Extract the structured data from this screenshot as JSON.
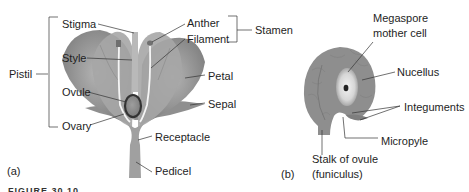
{
  "figure": {
    "caption_partial": "FIGURE 30.10",
    "panel_a": {
      "panel_label": "(a)",
      "group_labels": {
        "pistil": "Pistil",
        "stamen": "Stamen"
      },
      "labels": {
        "stigma": "Stigma",
        "style": "Style",
        "ovule": "Ovule",
        "ovary": "Ovary",
        "anther": "Anther",
        "filament": "Filament",
        "petal": "Petal",
        "sepal": "Sepal",
        "receptacle": "Receptacle",
        "pedicel": "Pedicel"
      }
    },
    "panel_b": {
      "panel_label": "(b)",
      "labels": {
        "megaspore_line1": "Megaspore",
        "megaspore_line2": "mother cell",
        "nucellus": "Nucellus",
        "integuments": "Integuments",
        "micropyle": "Micropyle",
        "stalk_line1": "Stalk of ovule",
        "stalk_line2": "(funiculus)"
      }
    },
    "colors": {
      "petal_fill": "#9a9a9a",
      "petal_dark": "#7a7a7a",
      "ovule_fill": "#8c8c8c",
      "leader_line": "#333333",
      "nucellus_center": "#e6e6e6"
    }
  }
}
